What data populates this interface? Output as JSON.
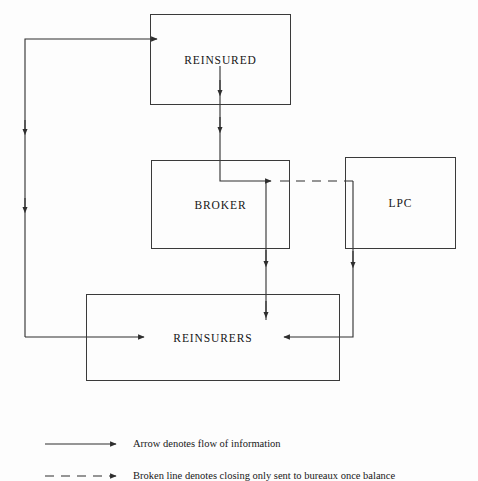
{
  "diagram": {
    "stroke_color": "#2e2e2e",
    "background_color": "#fdfdfd",
    "nodes": [
      {
        "id": "reinsured",
        "label": "REINSURED"
      },
      {
        "id": "broker",
        "label": "BROKER"
      },
      {
        "id": "lpc",
        "label": "LPC"
      },
      {
        "id": "reinsurers",
        "label": "REINSURERS"
      }
    ],
    "edges": [
      {
        "from": "reinsurers",
        "to": "reinsured",
        "style": "solid",
        "direction": "left"
      },
      {
        "from": "reinsured",
        "to": "broker",
        "style": "solid",
        "direction": "down"
      },
      {
        "from": "broker",
        "to": "lpc",
        "style": "dashed",
        "direction": "right"
      },
      {
        "from": "broker",
        "to": "reinsurers",
        "style": "solid",
        "direction": "down"
      },
      {
        "from": "lpc",
        "to": "reinsurers",
        "style": "solid",
        "direction": "left"
      }
    ]
  },
  "legend": {
    "items": [
      {
        "sample": "solid-arrow",
        "text": "Arrow denotes flow of information"
      },
      {
        "sample": "broken-arrow",
        "text": "Broken line denotes closing only sent to bureaux once balance"
      }
    ]
  }
}
